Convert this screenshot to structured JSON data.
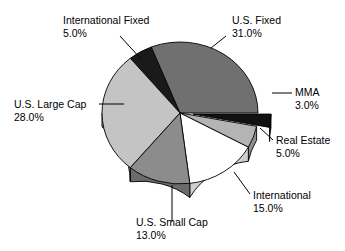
{
  "chart_data": {
    "type": "pie",
    "title": "",
    "subtitle": "",
    "xlabel": "",
    "ylabel": "",
    "legend_position": "none",
    "grid": false,
    "style": "3d-exploded-pie",
    "value_suffix": "%",
    "categories": [
      "U.S. Fixed",
      "MMA",
      "Real Estate",
      "International",
      "U.S. Small Cap",
      "U.S. Large Cap",
      "International Fixed"
    ],
    "values": [
      31.0,
      3.0,
      5.0,
      15.0,
      13.0,
      28.0,
      5.0
    ],
    "value_labels": [
      "31.0%",
      "3.0%",
      "5.0%",
      "15.0%",
      "13.0%",
      "28.0%",
      "5.0%"
    ],
    "total": 100.0,
    "slices": [
      {
        "name": "U.S. Fixed",
        "value": 31.0,
        "value_label": "31.0%",
        "color": "#707070",
        "side_color": "#575757",
        "exploded": false,
        "start_deg": 0,
        "end_deg": 111.6,
        "label_x": 232,
        "label_y": 24,
        "label_anchor": "start",
        "leader": "M 226 36 L 211 48"
      },
      {
        "name": "MMA",
        "value": 3.0,
        "value_label": "3.0%",
        "color": "#111111",
        "side_color": "#0a0a0a",
        "exploded": true,
        "start_deg": -10.8,
        "end_deg": 0,
        "label_x": 295,
        "label_y": 96,
        "label_anchor": "start",
        "leader": "M 292 93 L 272 93"
      },
      {
        "name": "Real Estate",
        "value": 5.0,
        "value_label": "5.0%",
        "color": "#b4b4b4",
        "side_color": "#8d8d8d",
        "exploded": false,
        "start_deg": -28.8,
        "end_deg": -10.8,
        "label_x": 276,
        "label_y": 144,
        "label_anchor": "start",
        "leader": "M 273 140 L 260 128"
      },
      {
        "name": "International",
        "value": 15.0,
        "value_label": "15.0%",
        "color": "#ffffff",
        "side_color": "#cfcfcf",
        "exploded": false,
        "start_deg": -82.8,
        "end_deg": -28.8,
        "label_x": 253,
        "label_y": 199,
        "label_anchor": "start",
        "leader": "M 250 194 L 234 172"
      },
      {
        "name": "U.S. Small Cap",
        "value": 13.0,
        "value_label": "13.0%",
        "color": "#8c8c8c",
        "side_color": "#6b6b6b",
        "exploded": false,
        "start_deg": -129.6,
        "end_deg": -82.8,
        "label_x": 136,
        "label_y": 226,
        "label_anchor": "start",
        "leader": "M 172 222 L 172 185"
      },
      {
        "name": "U.S. Large Cap",
        "value": 28.0,
        "value_label": "28.0%",
        "color": "#c4c4c4",
        "side_color": "#9b9b9b",
        "exploded": false,
        "start_deg": -230.4,
        "end_deg": -129.6,
        "label_x": 14,
        "label_y": 108,
        "label_anchor": "start",
        "leader": "M 99 104 L 124 104"
      },
      {
        "name": "International Fixed",
        "value": 5.0,
        "value_label": "5.0%",
        "color": "#1a1a1a",
        "side_color": "#121212",
        "exploded": false,
        "start_deg": -248.4,
        "end_deg": -230.4,
        "label_x": 63,
        "label_y": 24,
        "label_anchor": "start",
        "leader": "M 120 36 L 141 59"
      }
    ],
    "geometry": {
      "cx": 180,
      "cy": 113,
      "rx": 78,
      "ry": 71,
      "depth": 14,
      "explode_offset": 13
    },
    "background_color": "#ffffff",
    "outline_color": "#000000"
  }
}
